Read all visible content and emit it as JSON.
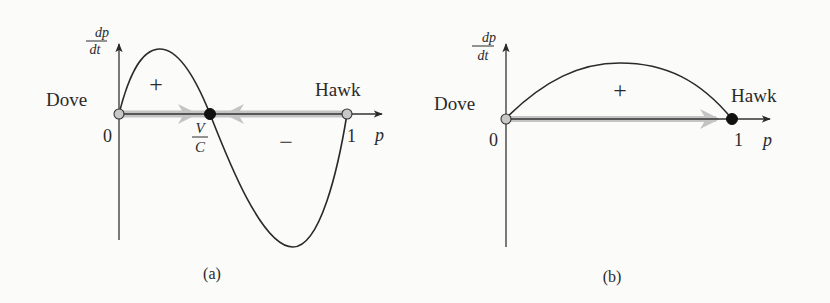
{
  "figure": {
    "panels": [
      {
        "id": "a",
        "caption": "(a)",
        "y_axis_label_num": "dp",
        "y_axis_label_den": "dt",
        "x_axis_label": "p",
        "origin_label": "0",
        "one_label": "1",
        "left_label": "Dove",
        "right_label": "Hawk",
        "interior_label_num": "V",
        "interior_label_den": "C",
        "positive_sign": "+",
        "negative_sign": "−",
        "fixed_points": [
          {
            "name": "Dove",
            "p": "0",
            "stability": "unstable",
            "fill": "#c8c8c8"
          },
          {
            "name": "V/C",
            "p": "V/C",
            "stability": "stable",
            "fill": "#111111"
          },
          {
            "name": "Hawk",
            "p": "1",
            "stability": "unstable",
            "fill": "#c8c8c8"
          }
        ],
        "flow_arrows": [
          "right (from 0 toward V/C)",
          "left (from 1 toward V/C)"
        ]
      },
      {
        "id": "b",
        "caption": "(b)",
        "y_axis_label_num": "dp",
        "y_axis_label_den": "dt",
        "x_axis_label": "p",
        "origin_label": "0",
        "one_label": "1",
        "left_label": "Dove",
        "right_label": "Hawk",
        "positive_sign": "+",
        "fixed_points": [
          {
            "name": "Dove",
            "p": "0",
            "stability": "unstable",
            "fill": "#c8c8c8"
          },
          {
            "name": "Hawk",
            "p": "1",
            "stability": "stable",
            "fill": "#111111"
          }
        ],
        "flow_arrows": [
          "right (from 0 toward 1)"
        ]
      }
    ],
    "colors": {
      "curve": "#2a2a2a",
      "axis": "#333333",
      "flow": "#b8b8b8",
      "unstable_point": "#c8c8c8",
      "stable_point": "#111111"
    }
  }
}
